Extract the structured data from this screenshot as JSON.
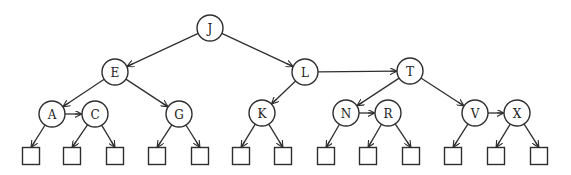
{
  "diagram": {
    "type": "threaded-tree",
    "colors": {
      "stroke": "#2f2f2f",
      "fill": "#ffffff",
      "text": "#222222"
    },
    "node_radius": 13,
    "leaf_size": 17,
    "nodes": [
      {
        "id": "J",
        "label": "J",
        "x": 210,
        "y": 28
      },
      {
        "id": "E",
        "label": "E",
        "x": 115,
        "y": 72
      },
      {
        "id": "L",
        "label": "L",
        "x": 305,
        "y": 72
      },
      {
        "id": "T",
        "label": "T",
        "x": 410,
        "y": 71
      },
      {
        "id": "A",
        "label": "A",
        "x": 52,
        "y": 114
      },
      {
        "id": "C",
        "label": "C",
        "x": 95,
        "y": 114
      },
      {
        "id": "G",
        "label": "G",
        "x": 179,
        "y": 114
      },
      {
        "id": "K",
        "label": "K",
        "x": 262,
        "y": 113
      },
      {
        "id": "N",
        "label": "N",
        "x": 346,
        "y": 113
      },
      {
        "id": "R",
        "label": "R",
        "x": 388,
        "y": 113
      },
      {
        "id": "V",
        "label": "V",
        "x": 475,
        "y": 113
      },
      {
        "id": "X",
        "label": "X",
        "x": 517,
        "y": 113
      }
    ],
    "leaves": [
      {
        "id": "leaf-1",
        "x": 31,
        "y": 156,
        "parent": "A"
      },
      {
        "id": "leaf-2",
        "x": 72,
        "y": 156,
        "parent": "C"
      },
      {
        "id": "leaf-3",
        "x": 115,
        "y": 156,
        "parent": "C"
      },
      {
        "id": "leaf-4",
        "x": 157,
        "y": 156,
        "parent": "G"
      },
      {
        "id": "leaf-5",
        "x": 200,
        "y": 156,
        "parent": "G"
      },
      {
        "id": "leaf-6",
        "x": 241,
        "y": 156,
        "parent": "K"
      },
      {
        "id": "leaf-7",
        "x": 283,
        "y": 156,
        "parent": "K"
      },
      {
        "id": "leaf-8",
        "x": 326,
        "y": 156,
        "parent": "N"
      },
      {
        "id": "leaf-9",
        "x": 368,
        "y": 156,
        "parent": "R"
      },
      {
        "id": "leaf-10",
        "x": 411,
        "y": 156,
        "parent": "R"
      },
      {
        "id": "leaf-11",
        "x": 453,
        "y": 156,
        "parent": "V"
      },
      {
        "id": "leaf-12",
        "x": 496,
        "y": 156,
        "parent": "X"
      },
      {
        "id": "leaf-13",
        "x": 539,
        "y": 156,
        "parent": "X"
      }
    ],
    "edges": [
      {
        "from": "J",
        "to": "E"
      },
      {
        "from": "J",
        "to": "L"
      },
      {
        "from": "E",
        "to": "A"
      },
      {
        "from": "E",
        "to": "G"
      },
      {
        "from": "A",
        "to": "C"
      },
      {
        "from": "L",
        "to": "K"
      },
      {
        "from": "L",
        "to": "T"
      },
      {
        "from": "T",
        "to": "N"
      },
      {
        "from": "T",
        "to": "V"
      },
      {
        "from": "N",
        "to": "R"
      },
      {
        "from": "V",
        "to": "X"
      }
    ]
  }
}
